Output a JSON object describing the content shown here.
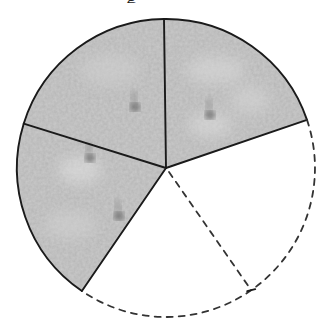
{
  "diagram": {
    "type": "sector-map",
    "caption_fragment": "g",
    "geometry": {
      "center": [
        166,
        168
      ],
      "radius": 149,
      "vertical_divider_end": [
        164,
        19
      ],
      "right_boundary_end": [
        301,
        122
      ],
      "left_divider_end": [
        28,
        125
      ],
      "lower_left_boundary_end": [
        84,
        288
      ],
      "dashed_radius_end": [
        249,
        287
      ]
    },
    "sectors": [
      {
        "id": "upper-left",
        "state": "imaged",
        "fill": "#b4b4b4"
      },
      {
        "id": "upper-right",
        "state": "imaged",
        "fill": "#b8b8b8"
      },
      {
        "id": "left",
        "state": "imaged",
        "fill": "#b2b2b2"
      },
      {
        "id": "lower-right-a",
        "state": "not-imaged",
        "border": "dashed"
      },
      {
        "id": "lower-right-b",
        "state": "not-imaged",
        "border": "dashed"
      }
    ],
    "features": [
      {
        "id": "spot-1",
        "x": 135,
        "y": 107
      },
      {
        "id": "spot-2",
        "x": 210,
        "y": 115
      },
      {
        "id": "spot-3",
        "x": 90,
        "y": 158
      },
      {
        "id": "spot-4",
        "x": 119,
        "y": 216
      }
    ],
    "colors": {
      "line": "#1a1a1a",
      "dashed_line": "#333333",
      "surface": "#b5b5b5",
      "spot": "#5a5a5a",
      "background": "#ffffff"
    }
  }
}
